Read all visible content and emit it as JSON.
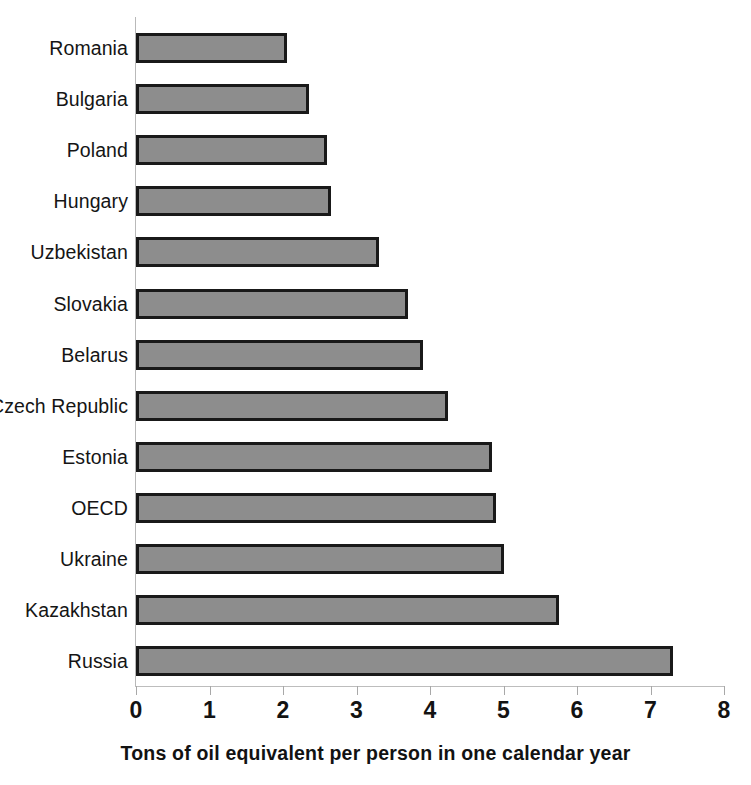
{
  "chart_data": {
    "type": "bar",
    "orientation": "horizontal",
    "title": "",
    "xlabel": "Tons of oil equivalent per person in one calendar year",
    "ylabel": "",
    "xlim": [
      0,
      8
    ],
    "xticks": [
      "0",
      "1",
      "2",
      "3",
      "4",
      "5",
      "6",
      "7",
      "8"
    ],
    "grid": false,
    "legend": false,
    "categories": [
      "Romania",
      "Bulgaria",
      "Poland",
      "Hungary",
      "Uzbekistan",
      "Slovakia",
      "Belarus",
      "Czech Republic",
      "Estonia",
      "OECD",
      "Ukraine",
      "Kazakhstan",
      "Russia"
    ],
    "values": [
      2.05,
      2.35,
      2.6,
      2.65,
      3.3,
      3.7,
      3.9,
      4.25,
      4.85,
      4.9,
      5.0,
      5.75,
      7.3
    ],
    "bar_fill_color": "#8d8d8d",
    "bar_border_color": "#191919",
    "axis_color": "#b9b9b9",
    "background_color": "#ffffff"
  }
}
